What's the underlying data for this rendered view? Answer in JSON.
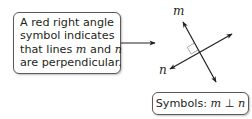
{
  "callout": {
    "line1": "A red right angle",
    "line2": "symbol indicates",
    "line3_pre": "that lines ",
    "line3_m": "m",
    "line3_mid": " and ",
    "line3_n": "n",
    "line4": "are perpendicular."
  },
  "figure": {
    "line_m_label": "m",
    "line_n_label": "n",
    "right_angle_marker_color": "#a0a0a0",
    "line_color": "#231f20"
  },
  "symbols_box": {
    "prefix": "Symbols: ",
    "var_m": "m",
    "perp_symbol": "⊥",
    "var_n": "n"
  }
}
